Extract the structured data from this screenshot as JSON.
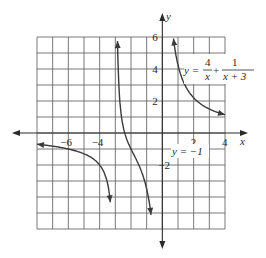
{
  "chart_data": {
    "type": "line",
    "title": "",
    "equation": {
      "lhs": "y =",
      "term1_num": "4",
      "term1_den": "x",
      "plus": "+",
      "term2_num": "1",
      "term2_den": "x + 3"
    },
    "asymptote_label": "y = −1",
    "xlabel": "x",
    "ylabel": "y",
    "xlim": [
      -8,
      4
    ],
    "ylim": [
      -6,
      6
    ],
    "grid": true,
    "x_ticks": [
      {
        "value": -6,
        "label": "−6"
      },
      {
        "value": -4,
        "label": "−4"
      },
      {
        "value": 2,
        "label": "2"
      },
      {
        "value": 4,
        "label": "4"
      }
    ],
    "y_ticks": [
      {
        "value": 6,
        "label": "6"
      },
      {
        "value": 4,
        "label": "4"
      },
      {
        "value": 2,
        "label": "2"
      },
      {
        "value": -2,
        "label": "−2"
      }
    ],
    "vertical_asymptotes": [
      -3,
      0
    ],
    "horizontal_asymptote": -1,
    "series": [
      {
        "name": "branch-left",
        "x": [
          -8,
          -7,
          -6,
          -5,
          -4.5,
          -4,
          -3.7,
          -3.5,
          -3.3
        ],
        "y": [
          -0.7,
          -0.82,
          -0.95,
          -1.3,
          -1.56,
          -2.0,
          -3.0,
          -4.1,
          -6.0
        ]
      },
      {
        "name": "branch-middle",
        "x": [
          -2.85,
          -2.7,
          -2.5,
          -2.2,
          -2.0,
          -1.8,
          -1.5,
          -1.2,
          -1.0,
          -0.8
        ],
        "y": [
          6.0,
          2.5,
          0.4,
          -0.6,
          -1.0,
          -1.4,
          -2.0,
          -2.8,
          -3.5,
          -5.2
        ]
      },
      {
        "name": "branch-right",
        "x": [
          0.7,
          1.0,
          1.5,
          2.0,
          2.5,
          3.0,
          4.0
        ],
        "y": [
          6.0,
          4.25,
          2.9,
          2.2,
          1.8,
          1.5,
          1.14
        ]
      }
    ]
  }
}
